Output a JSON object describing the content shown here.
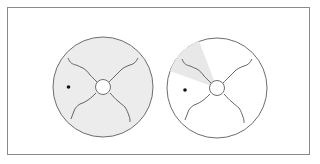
{
  "figure": {
    "colors": {
      "frame_border": "#8a8a8a",
      "circle_stroke": "#6e6e6e",
      "left_fill": "#ececec",
      "right_fill": "#ffffff",
      "sector_shade": "#e8e8e8",
      "dot": "#111111"
    },
    "panels": [
      {
        "name": "left",
        "cx": 103,
        "cy": 87,
        "r": 50,
        "filled": true,
        "shaded_sector": false,
        "dot": {
          "x": 68,
          "y": 87
        }
      },
      {
        "name": "right",
        "cx": 217,
        "cy": 88,
        "r": 50,
        "filled": false,
        "shaded_sector": true,
        "dot": {
          "x": 185,
          "y": 90
        }
      }
    ]
  }
}
